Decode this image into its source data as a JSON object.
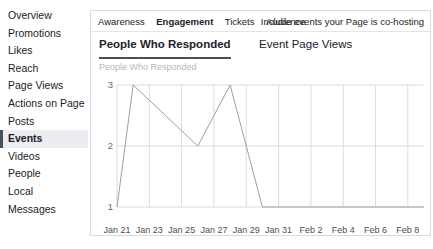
{
  "sidebar": {
    "items": [
      {
        "label": "Overview",
        "active": false
      },
      {
        "label": "Promotions",
        "active": false
      },
      {
        "label": "Likes",
        "active": false
      },
      {
        "label": "Reach",
        "active": false
      },
      {
        "label": "Page Views",
        "active": false
      },
      {
        "label": "Actions on Page",
        "active": false
      },
      {
        "label": "Posts",
        "active": false
      },
      {
        "label": "Events",
        "active": true
      },
      {
        "label": "Videos",
        "active": false
      },
      {
        "label": "People",
        "active": false
      },
      {
        "label": "Local",
        "active": false
      },
      {
        "label": "Messages",
        "active": false
      }
    ]
  },
  "panel": {
    "tabs": [
      {
        "label": "Awareness",
        "active": false
      },
      {
        "label": "Engagement",
        "active": true
      },
      {
        "label": "Tickets",
        "active": false
      },
      {
        "label": "Audience",
        "active": false
      }
    ],
    "cohost_note": "Include events your Page is co-hosting",
    "subtabs": [
      {
        "label": "People Who Responded",
        "active": true
      },
      {
        "label": "Event Page Views",
        "active": false
      }
    ]
  },
  "chart_data": {
    "type": "line",
    "title": "People Who Responded",
    "xlabel": "",
    "ylabel": "",
    "ylim": [
      1,
      3
    ],
    "yticks": [
      3,
      2,
      1
    ],
    "grid": true,
    "legend": "none",
    "line_color": "#9aa0a6",
    "grid_color": "#d9dbde",
    "x": [
      "Jan 21",
      "Jan 22",
      "Jan 23",
      "Jan 24",
      "Jan 25",
      "Jan 26",
      "Jan 27",
      "Jan 28",
      "Jan 29",
      "Jan 30",
      "Jan 31",
      "Feb 1",
      "Feb 2",
      "Feb 3",
      "Feb 4",
      "Feb 5",
      "Feb 6",
      "Feb 7",
      "Feb 8",
      "Feb 9"
    ],
    "xtick_labels": [
      "Jan 21",
      "Jan 23",
      "Jan 25",
      "Jan 27",
      "Jan 29",
      "Jan 31",
      "Feb 2",
      "Feb 4",
      "Feb 6",
      "Feb 8"
    ],
    "values": [
      1,
      3,
      2.75,
      2.5,
      2.25,
      2,
      2.5,
      3,
      2,
      1,
      1,
      1,
      1,
      1,
      1,
      1,
      1,
      1,
      1,
      1
    ],
    "series": [
      {
        "name": "People Who Responded",
        "values": [
          1,
          3,
          2.75,
          2.5,
          2.25,
          2,
          2.5,
          3,
          2,
          1,
          1,
          1,
          1,
          1,
          1,
          1,
          1,
          1,
          1,
          1
        ]
      }
    ]
  }
}
